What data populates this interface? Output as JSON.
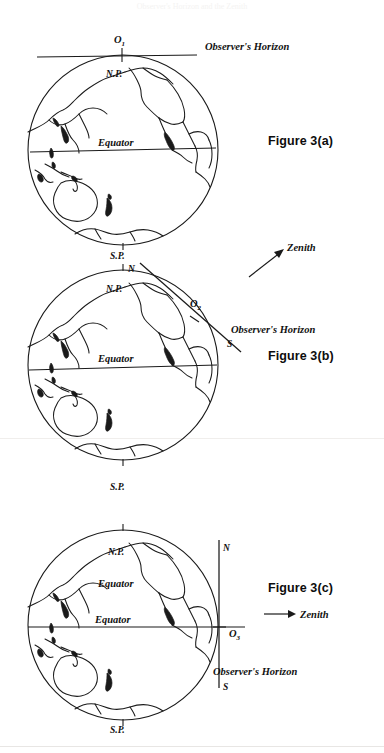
{
  "page": {
    "background_color": "#ffffff",
    "ink_color": "#1a1a1a",
    "ghost_header": "Observer's Horizon and the Zenith"
  },
  "figures": [
    {
      "id": "figure-a",
      "caption": "Figure 3(a)",
      "caption_x": 268,
      "caption_y": 143,
      "globe": {
        "cx": 123,
        "cy": 150,
        "r": 95
      },
      "labels": {
        "north_pole": "N.P.",
        "south_pole": "S.P.",
        "equator": "Equator",
        "observer_point": "O",
        "observer_point_sub": "1",
        "horizon": "Observer's Horizon"
      },
      "horizon": {
        "type": "horizontal",
        "x1": 37,
        "y1": 57,
        "x2": 197,
        "y2": 55,
        "tangent_at": "north-pole"
      },
      "equator_line": {
        "x1": 30,
        "y1": 152,
        "x2": 216,
        "y2": 148
      }
    },
    {
      "id": "figure-b",
      "caption": "Figure 3(b)",
      "caption_x": 268,
      "caption_y": 358,
      "globe": {
        "cx": 123,
        "cy": 365,
        "r": 95
      },
      "labels": {
        "north_pole": "N.P.",
        "south_pole": "S.P.",
        "equator": "Equator",
        "observer_point": "O",
        "observer_point_sub": "2",
        "horizon": "Observer's Horizon",
        "north_end": "N",
        "south_end": "S",
        "zenith": "Zenith"
      },
      "horizon": {
        "type": "tilted",
        "x1": 140,
        "y1": 263,
        "x2": 241,
        "y2": 352,
        "tangent_at": "mid-latitude"
      },
      "equator_line": {
        "x1": 29,
        "y1": 370,
        "x2": 217,
        "y2": 365
      },
      "zenith_arrow": {
        "x1": 250,
        "y1": 275,
        "x2": 283,
        "y2": 250
      }
    },
    {
      "id": "figure-c",
      "caption": "Figure 3(c)",
      "caption_x": 268,
      "caption_y": 590,
      "globe": {
        "cx": 123,
        "cy": 625,
        "r": 95
      },
      "labels": {
        "north_pole": "N.P.",
        "south_pole": "S.P.",
        "equator_upper": "Equator",
        "equator_lower": "Equator",
        "observer_point": "O",
        "observer_point_sub": "3",
        "horizon": "Observer's Horizon",
        "north_end": "N",
        "south_end": "S",
        "zenith": "Zenith"
      },
      "horizon": {
        "type": "vertical",
        "x1": 219,
        "y1": 540,
        "x2": 219,
        "y2": 688,
        "tangent_at": "equator"
      },
      "equator_line": {
        "x1": 28,
        "y1": 627,
        "x2": 245,
        "y2": 627
      },
      "zenith_arrow": {
        "x1": 266,
        "y1": 614,
        "x2": 297,
        "y2": 614
      }
    }
  ]
}
